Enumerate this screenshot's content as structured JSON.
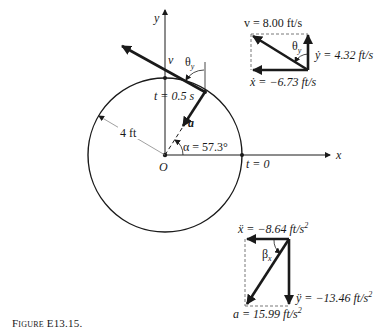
{
  "figure": {
    "caption_prefix": "Figure",
    "caption_id": "E13.15.",
    "colors": {
      "ink": "#1a1a1a",
      "background": "#ffffff",
      "dashed": "#555555",
      "radius_line": "#888888"
    }
  },
  "axes": {
    "x_label": "x",
    "y_label": "y",
    "origin_label": "O"
  },
  "circle": {
    "radius_label": "4 ft",
    "point_t0_label": "t = 0",
    "point_t05_label": "t = 0.5 s",
    "alpha_label": "α = 57.3°",
    "velocity_label": "v",
    "accel_label": "a",
    "theta_label": "θ",
    "theta_sub": "y"
  },
  "velocity_diagram": {
    "v_label": "v = 8.00 ft/s",
    "ydot_label": "ẏ = 4.32 ft/s",
    "xdot_label": "ẋ = −6.73 ft/s",
    "theta_label": "θ",
    "theta_sub": "y"
  },
  "acceleration_diagram": {
    "xddot_label": "ẍ = −8.64 ft/s",
    "xddot_exp": "2",
    "yddot_label": "ÿ = −13.46 ft/s",
    "yddot_exp": "2",
    "a_label": "a = 15.99 ft/s",
    "a_exp": "2",
    "beta_label": "β",
    "beta_sub": "x"
  }
}
